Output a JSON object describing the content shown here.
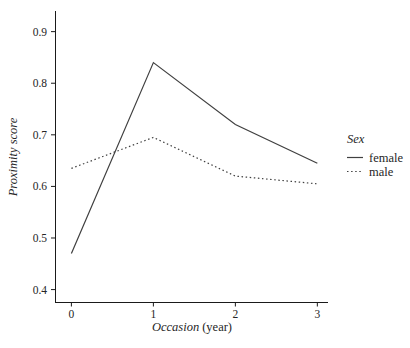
{
  "chart_data": {
    "type": "line",
    "title": "",
    "xlabel_italic": "Occasion",
    "xlabel_regular": "(year)",
    "ylabel": "Proximity score",
    "x": [
      0,
      1,
      2,
      3
    ],
    "series": [
      {
        "name": "female",
        "style": "solid",
        "values": [
          0.47,
          0.84,
          0.72,
          0.645
        ]
      },
      {
        "name": "male",
        "style": "dotted",
        "values": [
          0.635,
          0.695,
          0.62,
          0.605
        ]
      }
    ],
    "x_ticks": [
      0,
      1,
      2,
      3
    ],
    "y_ticks": [
      0.4,
      0.5,
      0.6,
      0.7,
      0.8,
      0.9
    ],
    "xlim": [
      -0.2,
      3.13
    ],
    "ylim": [
      0.374,
      0.94
    ],
    "grid": false,
    "legend": {
      "title": "Sex",
      "position": "right",
      "entries": [
        "female",
        "male"
      ]
    },
    "line_color": "#404040",
    "axis_color": "#1a1a1a",
    "text_color": "#262626",
    "background": "#ffffff"
  }
}
